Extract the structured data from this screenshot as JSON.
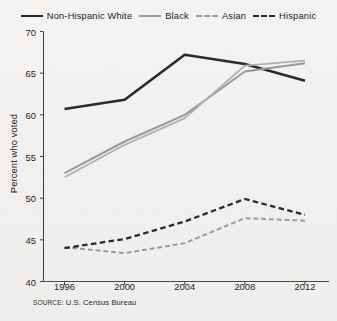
{
  "chart_data": {
    "type": "line",
    "title": "",
    "xlabel": "",
    "ylabel": "Percent who voted",
    "x": [
      1996,
      2000,
      2004,
      2008,
      2012
    ],
    "xtick_labels": [
      "1996",
      "2000",
      "2004",
      "2008",
      "2012"
    ],
    "ytick_labels": [
      "40",
      "45",
      "50",
      "55",
      "60",
      "65",
      "70"
    ],
    "yticks": [
      40,
      45,
      50,
      55,
      60,
      65,
      70
    ],
    "xlim": [
      1994.6,
      2013.6
    ],
    "ylim": [
      40,
      70
    ],
    "grid": false,
    "legend_position": "top",
    "series": [
      {
        "name": "Non-Hispanic White",
        "values": [
          60.7,
          61.8,
          67.2,
          66.1,
          64.1
        ],
        "color": "#2a2a2a",
        "style": "solid",
        "width": 2.6
      },
      {
        "name": "Black",
        "values": [
          53.0,
          56.8,
          60.0,
          65.2,
          66.2
        ],
        "color": "#9a9a9a",
        "style": "solid",
        "width": 2.0
      },
      {
        "name": "Asian",
        "values": [
          52.5,
          56.4,
          59.6,
          65.9,
          66.5
        ],
        "color": "#b0b0b0",
        "style": "solid",
        "width": 1.8
      },
      {
        "name": "Asian (dashed low)",
        "values": [
          44.1,
          43.4,
          44.6,
          47.6,
          47.3
        ],
        "color": "#9a9a9a",
        "style": "dashed",
        "width": 2.0
      },
      {
        "name": "Hispanic",
        "values": [
          44.0,
          45.1,
          47.2,
          49.9,
          48.0
        ],
        "color": "#2a2a2a",
        "style": "dashed",
        "width": 2.3
      }
    ],
    "annotations": {
      "source": "SOURCE: U.S. Census Bureau"
    }
  },
  "legend": {
    "entries": [
      {
        "label": "Non-Hispanic White",
        "swatch": "sw-white"
      },
      {
        "label": "Black",
        "swatch": "sw-black"
      },
      {
        "label": "Asian",
        "swatch": "sw-asian"
      },
      {
        "label": "Hispanic",
        "swatch": "sw-hisp"
      }
    ]
  },
  "axis": {
    "y_title": "Percent who voted"
  },
  "source": {
    "kicker": "SOURCE:",
    "text": " U.S. Census Bureau"
  }
}
